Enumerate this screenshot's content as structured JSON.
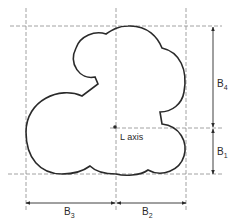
{
  "diagram": {
    "center_label": "L axis",
    "dimensions": {
      "b1": {
        "main": "B",
        "sub": "1"
      },
      "b2": {
        "main": "B",
        "sub": "2"
      },
      "b3": {
        "main": "B",
        "sub": "3"
      },
      "b4": {
        "main": "B",
        "sub": "4"
      }
    }
  },
  "colors": {
    "outline": "#2a2a2a",
    "guide": "#8a8a8a"
  }
}
